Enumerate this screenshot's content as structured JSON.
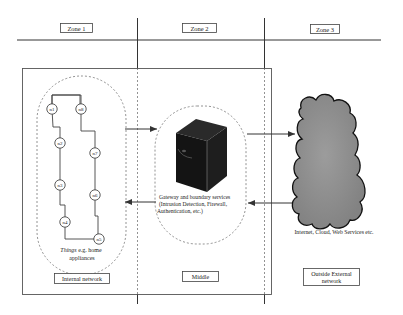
{
  "zones": [
    {
      "label": "Zone 1"
    },
    {
      "label": "Zone 2"
    },
    {
      "label": "Zone 3"
    }
  ],
  "regions": {
    "internal": "Internal network",
    "middle": "Middle",
    "external_line1": "Outside External",
    "external_line2": "network"
  },
  "things": {
    "nodes": [
      "n1",
      "n2",
      "n3",
      "n4",
      "n5",
      "n6",
      "n7",
      "n8"
    ],
    "caption_italic": "Things",
    "caption_rest": " e.g. home",
    "caption_line2": "appliances"
  },
  "gateway": {
    "line1": "Gateway and boundary services",
    "line2": "(Intrusion Detection, Firewall,",
    "line3": "Authentication,  etc.)"
  },
  "cloud": {
    "caption": "Internet, Cloud, Web Services etc."
  },
  "colors": {
    "line": "#333333",
    "dashed": "#888888",
    "server": "#1a1a1a",
    "cloud_fill": "#8c8c8c",
    "cloud_stroke": "#111111"
  }
}
